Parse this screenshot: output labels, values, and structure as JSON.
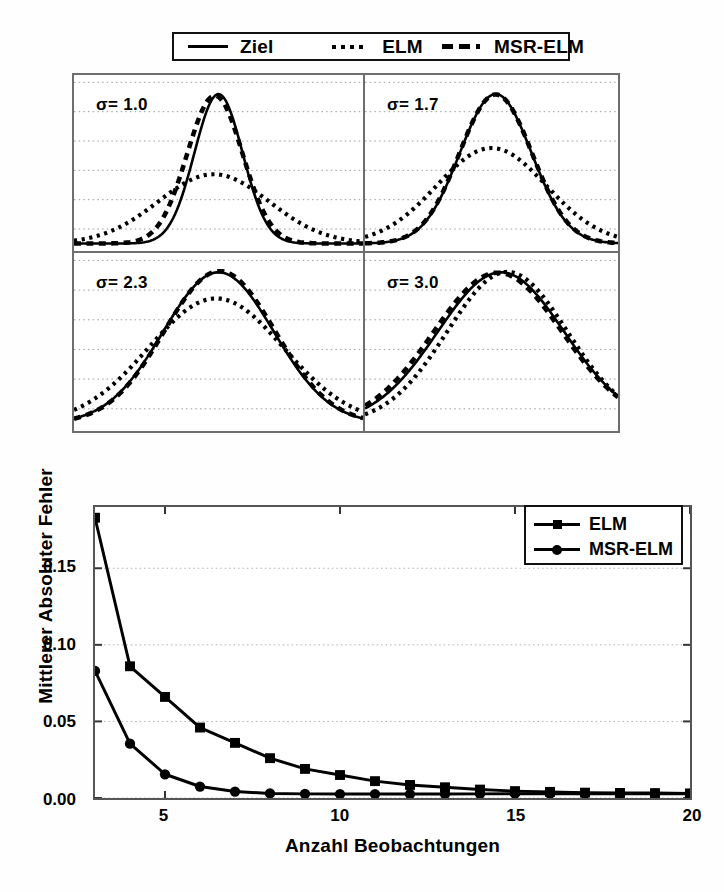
{
  "top_legend": {
    "entries": [
      {
        "label": "Ziel",
        "style": "solid"
      },
      {
        "label": "ELM",
        "style": "dotted"
      },
      {
        "label": "MSR-ELM",
        "style": "dashed"
      }
    ]
  },
  "panels": {
    "labels": [
      "σ= 1.0",
      "σ= 1.7",
      "σ= 2.3",
      "σ= 3.0"
    ]
  },
  "chart_data": [
    {
      "type": "line",
      "title": "",
      "panel_label": "σ= 1.0",
      "xlabel": "",
      "ylabel": "",
      "xlim": [
        -6,
        6
      ],
      "ylim": [
        -0.02,
        0.45
      ],
      "grid": true,
      "series": [
        {
          "name": "Ziel",
          "style": "solid",
          "sigma": 1.0,
          "amplitude": 0.399,
          "center": 0.0
        },
        {
          "name": "ELM",
          "style": "dotted",
          "sigma": 2.3,
          "amplitude": 0.185,
          "center": -0.2
        },
        {
          "name": "MSR-ELM",
          "style": "dashed",
          "sigma": 1.15,
          "amplitude": 0.395,
          "center": -0.15
        }
      ]
    },
    {
      "type": "line",
      "title": "",
      "panel_label": "σ= 1.7",
      "xlabel": "",
      "ylabel": "",
      "xlim": [
        -6,
        6
      ],
      "ylim": [
        -0.02,
        0.45
      ],
      "grid": true,
      "series": [
        {
          "name": "Ziel",
          "style": "solid",
          "sigma": 1.7,
          "amplitude": 0.399,
          "center": 0.2
        },
        {
          "name": "ELM",
          "style": "dotted",
          "sigma": 2.6,
          "amplitude": 0.255,
          "center": 0.0
        },
        {
          "name": "MSR-ELM",
          "style": "dashed",
          "sigma": 1.72,
          "amplitude": 0.398,
          "center": 0.2
        }
      ]
    },
    {
      "type": "line",
      "title": "",
      "panel_label": "σ= 2.3",
      "xlabel": "",
      "ylabel": "",
      "xlim": [
        -6,
        6
      ],
      "ylim": [
        -0.02,
        0.45
      ],
      "grid": true,
      "series": [
        {
          "name": "Ziel",
          "style": "solid",
          "sigma": 2.3,
          "amplitude": 0.399,
          "center": 0.0
        },
        {
          "name": "ELM",
          "style": "dotted",
          "sigma": 2.8,
          "amplitude": 0.33,
          "center": -0.1
        },
        {
          "name": "MSR-ELM",
          "style": "dashed",
          "sigma": 2.3,
          "amplitude": 0.402,
          "center": 0.05
        }
      ]
    },
    {
      "type": "line",
      "title": "",
      "panel_label": "σ= 3.0",
      "xlabel": "",
      "ylabel": "",
      "xlim": [
        -6,
        6
      ],
      "ylim": [
        -0.02,
        0.45
      ],
      "grid": true,
      "series": [
        {
          "name": "Ziel",
          "style": "solid",
          "sigma": 3.0,
          "amplitude": 0.399,
          "center": 0.45
        },
        {
          "name": "ELM",
          "style": "dotted",
          "sigma": 2.85,
          "amplitude": 0.4,
          "center": 0.75
        },
        {
          "name": "MSR-ELM",
          "style": "dashed",
          "sigma": 3.05,
          "amplitude": 0.398,
          "center": 0.3
        }
      ]
    },
    {
      "type": "line",
      "title": "",
      "xlabel": "Anzahl Beobachtungen",
      "ylabel": "Mittlerer Absoluter Fehler",
      "xlim": [
        3,
        20
      ],
      "ylim": [
        0.0,
        0.19
      ],
      "xticks": [
        5,
        10,
        15,
        20
      ],
      "xticklabels": [
        "5",
        "10",
        "15",
        "20"
      ],
      "yticks": [
        0.0,
        0.05,
        0.1,
        0.15
      ],
      "yticklabels": [
        "0.00",
        "0.05",
        "0.10",
        "0.15"
      ],
      "grid": true,
      "legend_position": "top-right",
      "x": [
        3,
        4,
        5,
        6,
        7,
        8,
        9,
        10,
        11,
        12,
        13,
        14,
        15,
        16,
        17,
        18,
        19,
        20
      ],
      "series": [
        {
          "name": "ELM",
          "marker": "square",
          "values": [
            0.183,
            0.086,
            0.066,
            0.046,
            0.036,
            0.026,
            0.019,
            0.015,
            0.011,
            0.0085,
            0.007,
            0.0055,
            0.0045,
            0.004,
            0.0035,
            0.0033,
            0.0032,
            0.003
          ]
        },
        {
          "name": "MSR-ELM",
          "marker": "circle",
          "values": [
            0.083,
            0.0355,
            0.0155,
            0.0075,
            0.0042,
            0.003,
            0.0027,
            0.0026,
            0.0026,
            0.0026,
            0.0026,
            0.0027,
            0.0028,
            0.0028,
            0.0028,
            0.0028,
            0.0028,
            0.0028
          ]
        }
      ]
    }
  ],
  "line_chart": {
    "ylabel": "Mittlerer Absoluter Fehler",
    "xlabel": "Anzahl Beobachtungen",
    "yticklabels": [
      "0.15",
      "0.10",
      "0.05",
      "0.00"
    ],
    "xticklabels": [
      "5",
      "10",
      "15",
      "20"
    ],
    "legend": [
      {
        "label": "ELM",
        "marker": "square"
      },
      {
        "label": "MSR-ELM",
        "marker": "circle"
      }
    ]
  }
}
